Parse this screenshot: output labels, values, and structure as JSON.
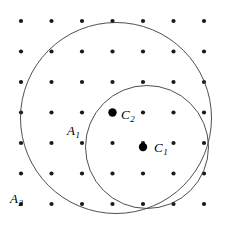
{
  "figure": {
    "background_color": "#ffffff",
    "width": 230,
    "height": 230
  },
  "labels": {
    "c1": {
      "base": "C",
      "sub": "1",
      "text": "C1"
    },
    "c2": {
      "base": "C",
      "sub": "2",
      "text": "C2"
    },
    "a1": {
      "base": "A",
      "sub": "1",
      "text": "A1"
    },
    "a2": {
      "base": "A",
      "sub": "2",
      "text": "A2"
    }
  },
  "chart_data": {
    "type": "scatter",
    "xlabel": "",
    "ylabel": "",
    "xlim": [
      0,
      230
    ],
    "ylim": [
      0,
      230
    ],
    "grid": false,
    "legend_position": "none",
    "lattice": {
      "name": "lattice-points",
      "color": "#1a1a1a",
      "radius": 2.1,
      "spacing_x": 30.5,
      "spacing_y": 30.5,
      "origin_x": 21,
      "origin_y": 21,
      "cols": 7,
      "rows": 7,
      "x": [
        21,
        51.5,
        82,
        112.5,
        143,
        173.5,
        204
      ],
      "y": [
        21,
        51.5,
        82,
        112.5,
        143,
        173.5,
        204
      ],
      "points": [
        [
          21,
          21
        ],
        [
          51.5,
          21
        ],
        [
          82,
          21
        ],
        [
          112.5,
          21
        ],
        [
          143,
          21
        ],
        [
          173.5,
          21
        ],
        [
          204,
          21
        ],
        [
          21,
          51.5
        ],
        [
          51.5,
          51.5
        ],
        [
          82,
          51.5
        ],
        [
          112.5,
          51.5
        ],
        [
          143,
          51.5
        ],
        [
          173.5,
          51.5
        ],
        [
          204,
          51.5
        ],
        [
          21,
          82
        ],
        [
          51.5,
          82
        ],
        [
          82,
          82
        ],
        [
          112.5,
          82
        ],
        [
          143,
          82
        ],
        [
          173.5,
          82
        ],
        [
          204,
          82
        ],
        [
          21,
          112.5
        ],
        [
          51.5,
          112.5
        ],
        [
          82,
          112.5
        ],
        [
          112.5,
          112.5
        ],
        [
          143,
          112.5
        ],
        [
          173.5,
          112.5
        ],
        [
          204,
          112.5
        ],
        [
          21,
          143
        ],
        [
          51.5,
          143
        ],
        [
          82,
          143
        ],
        [
          112.5,
          143
        ],
        [
          143,
          143
        ],
        [
          173.5,
          143
        ],
        [
          204,
          143
        ],
        [
          21,
          173.5
        ],
        [
          51.5,
          173.5
        ],
        [
          82,
          173.5
        ],
        [
          112.5,
          173.5
        ],
        [
          143,
          173.5
        ],
        [
          173.5,
          173.5
        ],
        [
          204,
          173.5
        ],
        [
          21,
          204
        ],
        [
          51.5,
          204
        ],
        [
          82,
          204
        ],
        [
          112.5,
          204
        ],
        [
          143,
          204
        ],
        [
          173.5,
          204
        ],
        [
          204,
          204
        ]
      ]
    },
    "circles": [
      {
        "name": "A2",
        "label": "A2",
        "cx": 116,
        "cy": 118,
        "r": 95.5,
        "stroke": "#3b3b3b",
        "stroke_width": 0.9,
        "fill": "none"
      },
      {
        "name": "A1",
        "label": "A1",
        "cx": 147,
        "cy": 147,
        "r": 61.5,
        "stroke": "#3b3b3b",
        "stroke_width": 0.9,
        "fill": "none"
      }
    ],
    "marked_points": [
      {
        "name": "C1",
        "label": "C1",
        "x": 143,
        "y": 147,
        "radius": 4.2,
        "color": "#000000"
      },
      {
        "name": "C2",
        "label": "C2",
        "x": 112.5,
        "y": 112.5,
        "radius": 4.2,
        "color": "#000000"
      }
    ],
    "annotations": [
      {
        "text": "C1",
        "x": 154,
        "y": 147
      },
      {
        "text": "C2",
        "x": 121,
        "y": 114
      },
      {
        "text": "A1",
        "x": 67,
        "y": 131
      },
      {
        "text": "A2",
        "x": 10,
        "y": 199
      }
    ]
  }
}
